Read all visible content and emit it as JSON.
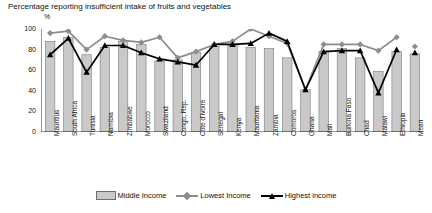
{
  "title": "Percentage reporting insufficient intake of fruits and vegetables",
  "y_axis_label": "%",
  "legend": {
    "items": [
      {
        "label": "Middle Income",
        "type": "bar",
        "color": "#c9c9c9"
      },
      {
        "label": "Lowest Income",
        "type": "line-diamond",
        "color": "#8c8c8c"
      },
      {
        "label": "Highest income",
        "type": "line-triangle",
        "color": "#000000"
      }
    ]
  },
  "chart_data": {
    "type": "bar",
    "title": "Percentage reporting insufficient intake of fruits and vegetables",
    "xlabel": "",
    "ylabel": "%",
    "ylim": [
      0,
      100
    ],
    "yticks": [
      0,
      20,
      40,
      60,
      80,
      100
    ],
    "grid": false,
    "legend_position": "bottom",
    "categories": [
      "Mauritius",
      "South Africa",
      "Tunisia",
      "Namibia",
      "Zimbabwe",
      "Morocco",
      "Swaziland",
      "Congo, Rep.",
      "Côte d'Ivoire",
      "Senegal",
      "Kenya",
      "Mauritania",
      "Zambia",
      "Comoros",
      "Ghana",
      "Mali",
      "Burkina Faso",
      "Chad",
      "Malawi",
      "Ethiopia",
      "Mean"
    ],
    "series": [
      {
        "name": "Middle Income",
        "type": "bar",
        "color": "#c9c9c9",
        "values": [
          88,
          92,
          75,
          82,
          88,
          85,
          69,
          70,
          77,
          83,
          84,
          82,
          81,
          72,
          41,
          78,
          81,
          72,
          59,
          78,
          76
        ]
      },
      {
        "name": "Lowest Income",
        "type": "line",
        "marker": "diamond",
        "color": "#8c8c8c",
        "values": [
          96,
          98,
          80,
          93,
          89,
          87,
          92,
          72,
          78,
          85,
          88,
          100,
          93,
          86,
          41,
          85,
          85,
          85,
          79,
          92,
          83
        ]
      },
      {
        "name": "Highest income",
        "type": "line",
        "marker": "triangle",
        "color": "#000000",
        "values": [
          75,
          91,
          58,
          84,
          84,
          77,
          71,
          68,
          65,
          85,
          85,
          86,
          96,
          88,
          41,
          78,
          79,
          79,
          38,
          80,
          77
        ]
      }
    ]
  }
}
